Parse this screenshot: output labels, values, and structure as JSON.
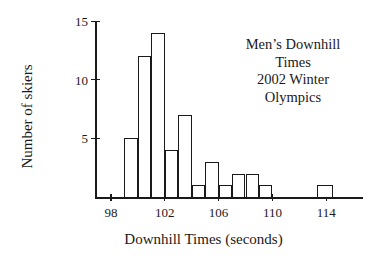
{
  "chart_data": {
    "type": "bar",
    "title": "",
    "annotation_lines": [
      "Men’s Downhill",
      "Times",
      "2002 Winter",
      "Olympics"
    ],
    "xlabel": "Downhill Times (seconds)",
    "ylabel": "Number of skiers",
    "xlim": [
      97.2,
      116.0
    ],
    "ylim": [
      0,
      15
    ],
    "grid": false,
    "legend": null,
    "bin_width": 1,
    "xticks": [
      98,
      102,
      106,
      110,
      114
    ],
    "xtick_labels": [
      "98",
      "102",
      "106",
      "110",
      "114"
    ],
    "yticks": [
      5,
      10,
      15
    ],
    "ytick_labels": [
      "5",
      "10",
      "15"
    ],
    "bins": [
      {
        "start": 99,
        "end": 100,
        "count": 5
      },
      {
        "start": 100,
        "end": 101,
        "count": 12
      },
      {
        "start": 101,
        "end": 102,
        "count": 14
      },
      {
        "start": 102,
        "end": 103,
        "count": 4
      },
      {
        "start": 103,
        "end": 104,
        "count": 7
      },
      {
        "start": 104,
        "end": 105,
        "count": 1
      },
      {
        "start": 105,
        "end": 106,
        "count": 3
      },
      {
        "start": 106,
        "end": 107,
        "count": 1
      },
      {
        "start": 107,
        "end": 108,
        "count": 2
      },
      {
        "start": 108,
        "end": 109,
        "count": 2
      },
      {
        "start": 109,
        "end": 110,
        "count": 1
      },
      {
        "start": 113.3,
        "end": 114.5,
        "count": 1
      }
    ],
    "categories": [
      "99-100",
      "100-101",
      "101-102",
      "102-103",
      "103-104",
      "104-105",
      "105-106",
      "106-107",
      "107-108",
      "108-109",
      "109-110",
      "113-114"
    ],
    "values": [
      5,
      12,
      14,
      4,
      7,
      1,
      3,
      1,
      2,
      2,
      1,
      1
    ],
    "colors": {
      "line": "#1a1a1a",
      "fill": "#ffffff",
      "background": "#ffffff"
    }
  }
}
